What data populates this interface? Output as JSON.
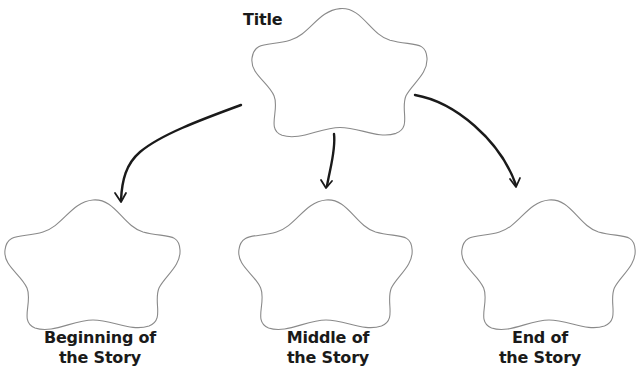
{
  "diagram": {
    "type": "story-map graphic organizer",
    "colors": {
      "background": "#ffffff",
      "outline": "#8a8a8a",
      "arrow": "#1a1a1a",
      "text": "#1a1a1a"
    },
    "nodes": [
      {
        "id": "title",
        "label_lines": [
          "Title"
        ],
        "shape": "flower-cloud"
      },
      {
        "id": "beginning",
        "label_lines": [
          "Beginning of",
          "the Story"
        ],
        "shape": "flower-cloud"
      },
      {
        "id": "middle",
        "label_lines": [
          "Middle of",
          "the Story"
        ],
        "shape": "flower-cloud"
      },
      {
        "id": "end",
        "label_lines": [
          "End of",
          "the Story"
        ],
        "shape": "flower-cloud"
      }
    ],
    "edges": [
      {
        "from": "title",
        "to": "beginning"
      },
      {
        "from": "title",
        "to": "middle"
      },
      {
        "from": "title",
        "to": "end"
      }
    ]
  }
}
